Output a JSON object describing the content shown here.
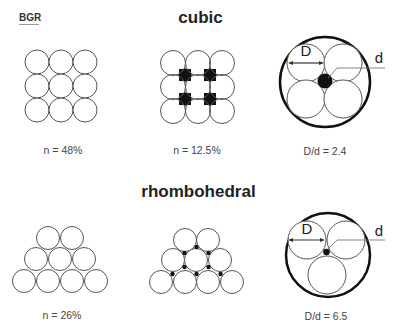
{
  "logo": {
    "text": "BGR"
  },
  "sections": {
    "cubic": {
      "title": "cubic",
      "panels": [
        {
          "id": "cubic-packing",
          "caption": "n = 48%"
        },
        {
          "id": "cubic-interstitial",
          "caption": "n = 12.5%"
        },
        {
          "id": "cubic-pore-ratio",
          "caption": "D/d = 2.4",
          "label_D": "D",
          "label_d": "d"
        }
      ]
    },
    "rhombohedral": {
      "title": "rhombohedral",
      "panels": [
        {
          "id": "rhombo-packing",
          "caption": "n = 26%"
        },
        {
          "id": "rhombo-interstitial",
          "caption": ""
        },
        {
          "id": "rhombo-pore-ratio",
          "caption": "D/d = 6.5",
          "label_D": "D",
          "label_d": "d"
        }
      ]
    }
  },
  "colors": {
    "stroke": "#555555",
    "fill_grain": "#ffffff",
    "fill_pore": "#111111",
    "outer_ring": "#111111",
    "text": "#444444"
  }
}
